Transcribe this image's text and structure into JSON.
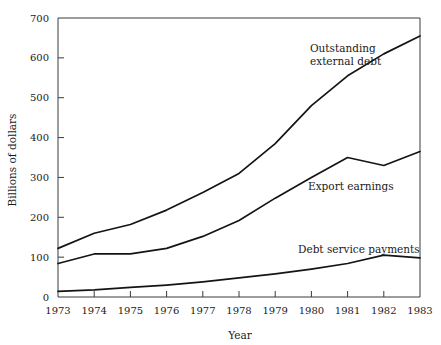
{
  "chart_data": {
    "type": "line",
    "title": "",
    "xlabel": "Year",
    "ylabel": "Billions of dollars",
    "x": [
      1973,
      1974,
      1975,
      1976,
      1977,
      1978,
      1979,
      1980,
      1981,
      1982,
      1983
    ],
    "categories": [
      "1973",
      "1974",
      "1975",
      "1976",
      "1977",
      "1978",
      "1979",
      "1980",
      "1981",
      "1982",
      "1983"
    ],
    "xlim": [
      1973,
      1983
    ],
    "ylim": [
      0,
      700
    ],
    "yticks": [
      0,
      100,
      200,
      300,
      400,
      500,
      600,
      700
    ],
    "ytick_labels": [
      "0",
      "100",
      "200",
      "300",
      "400",
      "500",
      "600",
      "700"
    ],
    "xtick_labels": [
      "1973",
      "1974",
      "1975",
      "1976",
      "1977",
      "1978",
      "1979",
      "1980",
      "1981",
      "1982",
      "1983"
    ],
    "grid": false,
    "legend_position": "inline-annotations",
    "series": [
      {
        "name": "Outstanding external debt",
        "label_lines": [
          "Outstanding",
          "external debt"
        ],
        "values": [
          122,
          160,
          182,
          218,
          262,
          310,
          385,
          480,
          555,
          610,
          655
        ]
      },
      {
        "name": "Export earnings",
        "label_lines": [
          "Export earnings"
        ],
        "values": [
          84,
          108,
          108,
          122,
          152,
          192,
          248,
          300,
          350,
          330,
          365
        ]
      },
      {
        "name": "Debt service payments",
        "label_lines": [
          "Debt service payments"
        ],
        "values": [
          14,
          18,
          24,
          30,
          38,
          48,
          58,
          70,
          84,
          105,
          98
        ]
      }
    ],
    "annotations": [
      {
        "text": "Outstanding external debt",
        "anchor_year": 1980,
        "anchor_value": 620
      },
      {
        "text": "Export earnings",
        "anchor_year": 1980.3,
        "anchor_value": 315
      },
      {
        "text": "Debt service payments",
        "anchor_year": 1979.6,
        "anchor_value": 148
      }
    ],
    "colors": {
      "line": "#141414",
      "axis": "#3a3a3a",
      "background": "#ffffff"
    }
  }
}
